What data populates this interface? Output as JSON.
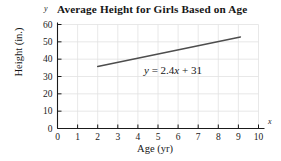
{
  "chart_data": {
    "type": "line",
    "title": "Average Height for Girls Based on Age",
    "xlabel": "Age (yr)",
    "ylabel": "Height (in.)",
    "x_axis_letter": "y",
    "y_axis_letter": "x",
    "xlim": [
      0,
      10
    ],
    "ylim": [
      0,
      60
    ],
    "xticks": [
      0,
      1,
      2,
      3,
      4,
      5,
      6,
      7,
      8,
      9,
      10
    ],
    "xtick_labels": [
      "0",
      "1",
      "2",
      "3",
      "4",
      "5",
      "6",
      "7",
      "8",
      "9",
      "10"
    ],
    "yticks": [
      0,
      10,
      20,
      30,
      40,
      50,
      60
    ],
    "ytick_labels": [
      "0",
      "10",
      "20",
      "30",
      "40",
      "50",
      "60"
    ],
    "grid": true,
    "legend": "none",
    "annotations": [
      {
        "text": "y = 2.4x + 31",
        "text_lhs": "y",
        "text_eq": " = 2.4",
        "text_var": "x",
        "text_rhs": " + 31",
        "x": 5.2,
        "y": 31.5
      }
    ],
    "series": [
      {
        "name": "Average height trend",
        "equation": "y = 2.4x + 31",
        "slope": 2.4,
        "intercept": 31,
        "x": [
          2,
          9.1
        ],
        "values": [
          35.8,
          52.84
        ],
        "color": "#4d4d4d"
      }
    ],
    "colors": {
      "line": "#4d4d4d",
      "axis": "#1a1a1a",
      "grid": "#e2e2e2",
      "background": "#ffffff"
    }
  }
}
